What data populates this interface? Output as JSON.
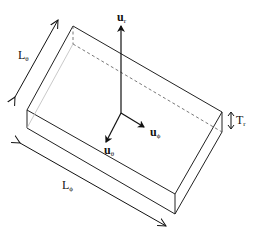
{
  "figure": {
    "kind": "diagram"
  },
  "labels": {
    "u_r": {
      "base": "u",
      "sub": "r"
    },
    "u_phi": {
      "base": "u",
      "sub": "ϕ"
    },
    "u_theta": {
      "base": "u",
      "sub": "θ"
    },
    "L_theta": {
      "base": "L",
      "sub": "θ"
    },
    "L_phi": {
      "base": "L",
      "sub": "ϕ"
    },
    "T_r": {
      "base": "T",
      "sub": "r"
    }
  },
  "colors": {
    "line": "#222222",
    "hidden_line": "#555555",
    "faint_edge": "#bbbbbb",
    "background": "#ffffff"
  }
}
